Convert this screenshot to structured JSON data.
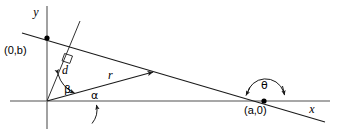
{
  "figure": {
    "background_color": "#ffffff",
    "axis_color": "#8a8a8a",
    "line_color": "#1a1a1a",
    "width": 345,
    "height": 129
  },
  "axes": {
    "x_label": "x",
    "y_label": "y",
    "origin_label": "",
    "x_axis_name": "horizontal-axis",
    "y_axis_name": "vertical-axis"
  },
  "points": [
    {
      "id": "y-intercept",
      "label": "(0,b)",
      "x": 47,
      "y": 38
    },
    {
      "id": "x-intercept",
      "label": "(a,0)",
      "x": 264,
      "y": 101
    }
  ],
  "labels": {
    "y_intercept": "(0,b)",
    "x_intercept": "(a,0)",
    "distance": "d",
    "radius": "r",
    "alpha": "α",
    "beta": "β",
    "theta": "θ",
    "x_axis": "x",
    "y_axis": "y"
  },
  "angles": [
    {
      "id": "alpha",
      "symbol": "α",
      "between": "x-axis and r-vector",
      "vertex": "origin"
    },
    {
      "id": "beta",
      "symbol": "β",
      "between": "d-segment and r-vector",
      "vertex": "origin"
    },
    {
      "id": "theta",
      "symbol": "θ",
      "between": "x-axis and slanted line",
      "vertex": "(a,0)"
    }
  ],
  "segments": [
    {
      "id": "d",
      "symbol": "d",
      "description": "perpendicular distance from origin to line"
    },
    {
      "id": "r",
      "symbol": "r",
      "description": "ray from origin to point on line"
    }
  ]
}
